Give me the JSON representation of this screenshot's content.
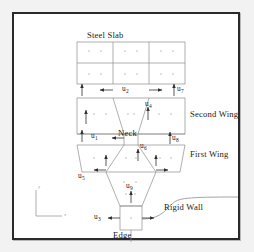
{
  "figure": {
    "title": "Steel Slab",
    "region_labels": {
      "steel_slab": "Steel Slab",
      "second_wing": "Second Wing",
      "neck": "Neck",
      "first_wing": "First Wing",
      "rigid_wall": "Rigid Wall",
      "edge": "Edge"
    },
    "dof_labels": [
      {
        "id": "u1",
        "base": "u",
        "sub": "1"
      },
      {
        "id": "u2",
        "base": "u",
        "sub": "2"
      },
      {
        "id": "u3",
        "base": "u",
        "sub": "3"
      },
      {
        "id": "u4",
        "base": "u",
        "sub": "4"
      },
      {
        "id": "u5",
        "base": "u",
        "sub": "5"
      },
      {
        "id": "u6",
        "base": "u",
        "sub": "6"
      },
      {
        "id": "u7",
        "base": "u",
        "sub": "7"
      },
      {
        "id": "u8",
        "base": "u",
        "sub": "8"
      },
      {
        "id": "u9",
        "base": "u",
        "sub": "9"
      }
    ],
    "axis_indicator": {
      "x_label": "x",
      "y_label": "y"
    },
    "colors": {
      "frame": "#2a2a2a",
      "mesh_line": "#8d8d8d",
      "mesh_dot": "#a9a9a9",
      "arrow": "#303030",
      "text": "#1b1b1b",
      "background": "#ffffff"
    }
  }
}
